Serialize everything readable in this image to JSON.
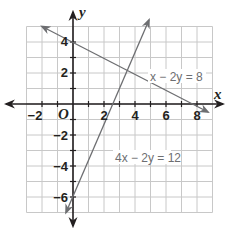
{
  "chart_data": {
    "type": "line",
    "title": "",
    "xlabel": "x",
    "ylabel": "y",
    "origin_label": "O",
    "xlim": [
      -3,
      9
    ],
    "ylim": [
      -7,
      5
    ],
    "grid": true,
    "grid_step": 1,
    "x_ticks": [
      -2,
      2,
      4,
      6,
      8
    ],
    "y_ticks": [
      4,
      2,
      -2,
      -4,
      -6
    ],
    "x_tick_labels": [
      "−2",
      "2",
      "4",
      "6",
      "8"
    ],
    "y_tick_labels": [
      "4",
      "2",
      "−2",
      "−4",
      "−6"
    ],
    "series": [
      {
        "name": "x − 2y = 8",
        "equation": "x - 2y = 8",
        "slope": 0.5,
        "intercept": -4,
        "display_intercept_y": 4,
        "points": [
          [
            -2,
            5
          ],
          [
            0,
            4
          ],
          [
            4,
            2
          ],
          [
            8,
            0
          ],
          [
            9,
            -0.5
          ]
        ],
        "label": "x − 2y = 8",
        "color": "#6d6e71"
      },
      {
        "name": "4x − 2y = 12",
        "equation": "4x - 2y = 12",
        "slope": 2,
        "intercept": -6,
        "points": [
          [
            -0.5,
            -7
          ],
          [
            0,
            -6
          ],
          [
            3,
            0
          ],
          [
            4,
            2
          ],
          [
            5.5,
            5
          ]
        ],
        "label": "4x − 2y = 12",
        "color": "#6d6e71"
      }
    ],
    "intersection": [
      4,
      2
    ]
  },
  "labels": {
    "x_axis": "x",
    "y_axis": "y",
    "origin": "O",
    "line1": "x − 2y = 8",
    "line2": "4x − 2y = 12",
    "xt0": "−2",
    "xt1": "2",
    "xt2": "4",
    "xt3": "6",
    "xt4": "8",
    "yt0": "4",
    "yt1": "2",
    "yt2": "−2",
    "yt3": "−4",
    "yt4": "−6"
  },
  "colors": {
    "grid": "#c8c8c8",
    "axis": "#231f20",
    "line": "#6d6e71"
  }
}
